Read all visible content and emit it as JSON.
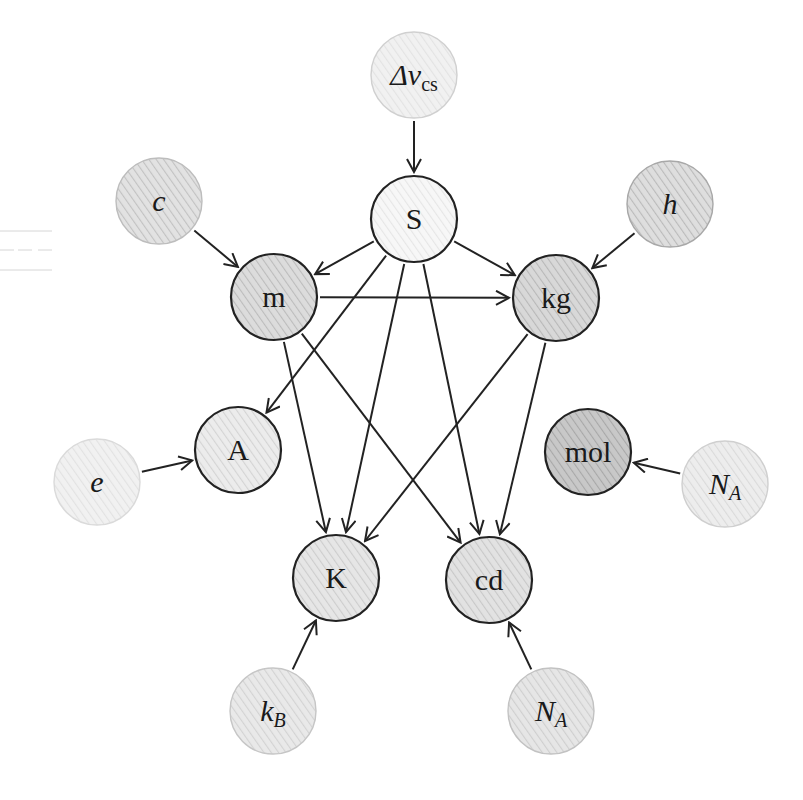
{
  "diagram": {
    "nodes": [
      {
        "id": "dvcs",
        "main": "Δν",
        "sub": "cs",
        "sub_style": "roman",
        "style": "italic",
        "kind": "constant",
        "x": 414,
        "y": 75,
        "fill": "#f1f1f1",
        "hatch": "#e3e3e3",
        "stroke": "#d0d0d0"
      },
      {
        "id": "S",
        "main": "S",
        "sub": "",
        "style": "roman",
        "kind": "unit",
        "x": 414,
        "y": 219,
        "fill": "#f7f7f7",
        "hatch": "#e6e6e6",
        "stroke": "#222222"
      },
      {
        "id": "c",
        "main": "c",
        "sub": "",
        "style": "italic",
        "kind": "constant",
        "x": 159,
        "y": 201,
        "fill": "#e2e2e2",
        "hatch": "#c2c2c2",
        "stroke": "#bdbdbd"
      },
      {
        "id": "h",
        "main": "h",
        "sub": "",
        "style": "italic",
        "kind": "constant",
        "x": 670,
        "y": 204,
        "fill": "#dedede",
        "hatch": "#bbbbbb",
        "stroke": "#a8a8a8"
      },
      {
        "id": "m",
        "main": "m",
        "sub": "",
        "style": "roman",
        "kind": "unit",
        "x": 274,
        "y": 297,
        "fill": "#dcdcdc",
        "hatch": "#bcbcbc",
        "stroke": "#222222"
      },
      {
        "id": "kg",
        "main": "kg",
        "sub": "",
        "style": "roman",
        "kind": "unit",
        "x": 556,
        "y": 298,
        "fill": "#d8d8d8",
        "hatch": "#b8b8b8",
        "stroke": "#222222"
      },
      {
        "id": "A",
        "main": "A",
        "sub": "",
        "style": "roman",
        "kind": "unit",
        "x": 238,
        "y": 450,
        "fill": "#ececec",
        "hatch": "#d4d4d4",
        "stroke": "#222222"
      },
      {
        "id": "mol",
        "main": "mol",
        "sub": "",
        "style": "roman",
        "kind": "unit",
        "x": 588,
        "y": 452,
        "fill": "#c8c8c8",
        "hatch": "#a8a8a8",
        "stroke": "#222222"
      },
      {
        "id": "e",
        "main": "e",
        "sub": "",
        "style": "italic",
        "kind": "constant",
        "x": 97,
        "y": 482,
        "fill": "#f1f1f1",
        "hatch": "#e2e2e2",
        "stroke": "#dadada"
      },
      {
        "id": "NA_right",
        "main": "N",
        "sub": "A",
        "sub_style": "italic",
        "style": "italic",
        "kind": "constant",
        "x": 725,
        "y": 484,
        "fill": "#ededed",
        "hatch": "#dadada",
        "stroke": "#cfcfcf"
      },
      {
        "id": "K",
        "main": "K",
        "sub": "",
        "style": "roman",
        "kind": "unit",
        "x": 336,
        "y": 578,
        "fill": "#e6e6e6",
        "hatch": "#cdcdcd",
        "stroke": "#222222"
      },
      {
        "id": "cd",
        "main": "cd",
        "sub": "",
        "style": "roman",
        "kind": "unit",
        "x": 489,
        "y": 580,
        "fill": "#e2e2e2",
        "hatch": "#c8c8c8",
        "stroke": "#222222"
      },
      {
        "id": "kB",
        "main": "k",
        "sub": "B",
        "sub_style": "italic",
        "style": "italic",
        "kind": "constant",
        "x": 273,
        "y": 711,
        "fill": "#e9e9e9",
        "hatch": "#d3d3d3",
        "stroke": "#c6c6c6"
      },
      {
        "id": "NA_bottom",
        "main": "N",
        "sub": "A",
        "sub_style": "italic",
        "style": "italic",
        "kind": "constant",
        "x": 551,
        "y": 711,
        "fill": "#e6e6e6",
        "hatch": "#cfcfcf",
        "stroke": "#c2c2c2"
      }
    ],
    "edges": [
      {
        "from": "dvcs",
        "to": "S"
      },
      {
        "from": "c",
        "to": "m"
      },
      {
        "from": "h",
        "to": "kg"
      },
      {
        "from": "S",
        "to": "m"
      },
      {
        "from": "S",
        "to": "kg"
      },
      {
        "from": "S",
        "to": "A"
      },
      {
        "from": "S",
        "to": "K"
      },
      {
        "from": "S",
        "to": "cd"
      },
      {
        "from": "m",
        "to": "kg"
      },
      {
        "from": "m",
        "to": "K"
      },
      {
        "from": "m",
        "to": "cd"
      },
      {
        "from": "kg",
        "to": "K"
      },
      {
        "from": "kg",
        "to": "cd"
      },
      {
        "from": "e",
        "to": "A"
      },
      {
        "from": "NA_right",
        "to": "mol"
      },
      {
        "from": "kB",
        "to": "K"
      },
      {
        "from": "NA_bottom",
        "to": "cd"
      }
    ],
    "node_radius": 43
  }
}
